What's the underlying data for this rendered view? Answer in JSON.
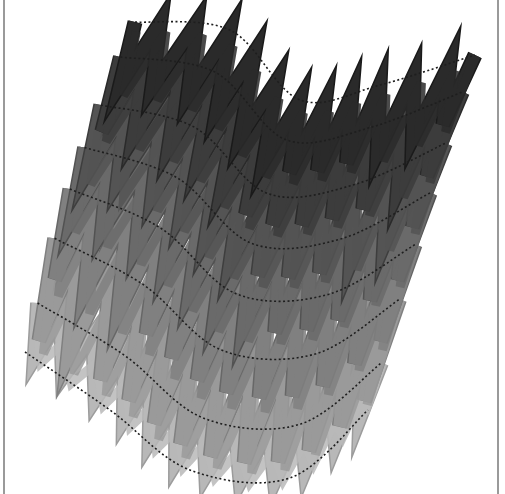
{
  "figure": {
    "width": 505,
    "height": 494,
    "frame_color": "#9a9a9a",
    "dash_color": "#1e1e1e",
    "surface": {
      "top_edge": [
        [
          135,
          22
        ],
        [
          230,
          30
        ],
        [
          300,
          100
        ],
        [
          380,
          85
        ],
        [
          475,
          55
        ]
      ],
      "bottom_edge": [
        [
          25,
          352
        ],
        [
          110,
          410
        ],
        [
          190,
          470
        ],
        [
          290,
          478
        ],
        [
          368,
          410
        ]
      ],
      "left_edge_mid": [
        [
          135,
          22
        ],
        [
          95,
          120
        ],
        [
          60,
          220
        ],
        [
          25,
          352
        ]
      ],
      "right_edge_mid": [
        [
          475,
          55
        ],
        [
          440,
          160
        ],
        [
          405,
          280
        ],
        [
          368,
          410
        ]
      ]
    },
    "rows": [
      {
        "fill": "#2a2a2a",
        "edge": "#1a1a1a"
      },
      {
        "fill": "#3c3c3c",
        "edge": "#2a2a2a"
      },
      {
        "fill": "#545454",
        "edge": "#3e3e3e"
      },
      {
        "fill": "#6a6a6a",
        "edge": "#525252"
      },
      {
        "fill": "#808080",
        "edge": "#676767"
      },
      {
        "fill": "#9a9a9a",
        "edge": "#808080"
      },
      {
        "fill": "#b8b8b8",
        "edge": "#9c9c9c"
      }
    ],
    "zigzag_peaks_per_row": 12,
    "dashed_curves": 8
  }
}
